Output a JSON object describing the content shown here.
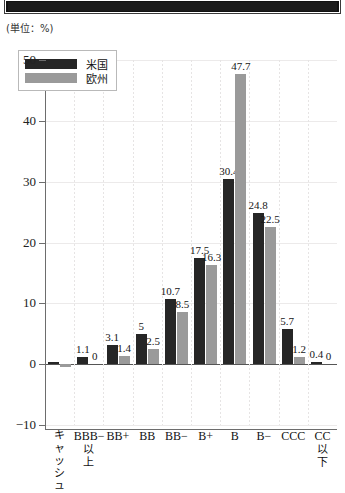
{
  "banner": {
    "present": true,
    "color": "#1b1b1b"
  },
  "unit_note": "(単位：%)",
  "legend": {
    "items": [
      {
        "label": "米国",
        "color": "#262626",
        "key": "us"
      },
      {
        "label": "欧州",
        "color": "#9a9a9a",
        "key": "eu"
      }
    ]
  },
  "axis": {
    "y_ticks": [
      "50",
      "40",
      "30",
      "20",
      "10",
      "0",
      "−10"
    ],
    "x_labels": [
      {
        "main": "キャッシュ",
        "sub": "",
        "vertical": true
      },
      {
        "main": "BBB−",
        "sub": "以上",
        "vertical": false
      },
      {
        "main": "BB+",
        "sub": "",
        "vertical": false
      },
      {
        "main": "BB",
        "sub": "",
        "vertical": false
      },
      {
        "main": "BB−",
        "sub": "",
        "vertical": false
      },
      {
        "main": "B+",
        "sub": "",
        "vertical": false
      },
      {
        "main": "B",
        "sub": "",
        "vertical": false
      },
      {
        "main": "B−",
        "sub": "",
        "vertical": false
      },
      {
        "main": "CCC",
        "sub": "",
        "vertical": false
      },
      {
        "main": "CC",
        "sub": "以下",
        "vertical": false
      }
    ]
  },
  "chart_data": {
    "type": "bar",
    "title": "",
    "subtitle": "",
    "xlabel": "",
    "ylabel": "",
    "unit": "%",
    "ylim": [
      -10,
      50
    ],
    "yticks": [
      -10,
      0,
      10,
      20,
      30,
      40,
      50
    ],
    "grid": true,
    "legend_position": "top-left",
    "categories": [
      "キャッシュ",
      "BBB−以上",
      "BB+",
      "BB",
      "BB−",
      "B+",
      "B",
      "B−",
      "CCC",
      "CC以下"
    ],
    "series": [
      {
        "name": "米国",
        "color": "#262626",
        "values": [
          0.4,
          1.1,
          3.1,
          5,
          10.7,
          17.5,
          30.4,
          24.8,
          5.7,
          0.4
        ],
        "labels": [
          "",
          "1.1",
          "3.1",
          "5",
          "10.7",
          "17.5",
          "30.4",
          "24.8",
          "5.7",
          "0.4"
        ]
      },
      {
        "name": "欧州",
        "color": "#9a9a9a",
        "values": [
          -0.5,
          0,
          1.4,
          2.5,
          8.5,
          16.3,
          47.7,
          22.5,
          1.2,
          0
        ],
        "labels": [
          "",
          "0",
          "1.4",
          "2.5",
          "8.5",
          "16.3",
          "47.7",
          "22.5",
          "1.2",
          "0"
        ]
      }
    ]
  }
}
